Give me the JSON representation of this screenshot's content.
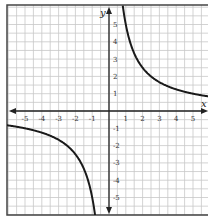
{
  "chart_data": {
    "type": "line",
    "title": "",
    "function": "y = 5/x",
    "xlabel": "x",
    "ylabel": "y",
    "xlim": [
      -6,
      6
    ],
    "ylim": [
      -6,
      6
    ],
    "grid": true,
    "grid_step": 0.5,
    "x_ticks": [
      "-5",
      "-4",
      "-3",
      "-2",
      "-1",
      "1",
      "2",
      "3",
      "4",
      "5"
    ],
    "y_ticks": [
      "5",
      "4",
      "3",
      "2",
      "1",
      "-1",
      "-2",
      "-3",
      "-4",
      "-5"
    ],
    "series": [
      {
        "name": "branch-positive",
        "x": [
          0.85,
          1,
          1.25,
          1.5,
          2,
          2.5,
          3,
          4,
          5,
          5.9
        ],
        "y": [
          5.9,
          5,
          4,
          3.33,
          2.5,
          2,
          1.67,
          1.25,
          1,
          0.85
        ]
      },
      {
        "name": "branch-negative",
        "x": [
          -5.9,
          -5,
          -4,
          -3,
          -2.5,
          -2,
          -1.5,
          -1.25,
          -1,
          -0.85
        ],
        "y": [
          -0.85,
          -1,
          -1.25,
          -1.67,
          -2,
          -2.5,
          -3.33,
          -4,
          -5,
          -5.9
        ]
      }
    ],
    "colors": {
      "curve": "#1a1a1a",
      "axis": "#222222",
      "grid": "#c8c8c8",
      "frame": "#444444"
    }
  }
}
